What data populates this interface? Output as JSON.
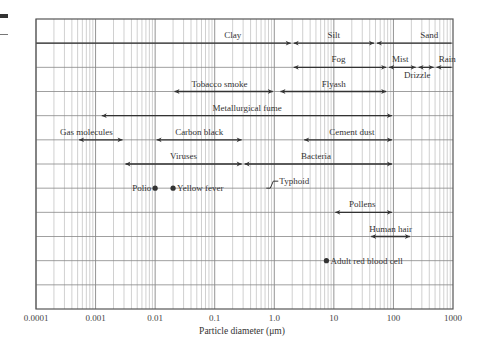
{
  "chart_data": {
    "type": "range-chart",
    "title": "",
    "xlabel": "Particle diameter (μm)",
    "ylabel": "",
    "xscale": "log",
    "xlim": [
      0.0001,
      1000
    ],
    "x_ticks": [
      "0.0001",
      "0.001",
      "0.01",
      "0.1",
      "1.0",
      "10",
      "100",
      "1000"
    ],
    "grid": true,
    "rows": 12,
    "ranges": [
      {
        "label": "Clay",
        "row": 1,
        "min": 0.0001,
        "max": 2,
        "left_open": true,
        "label_x": 0.2
      },
      {
        "label": "Silt",
        "row": 1,
        "min": 2,
        "max": 50,
        "label_x": 10
      },
      {
        "label": "Sand",
        "row": 1,
        "min": 50,
        "max": 1000,
        "label_x": 400
      },
      {
        "label": "Fog",
        "row": 2,
        "min": 2,
        "max": 80,
        "label_x": 12
      },
      {
        "label": "Mist",
        "row": 2,
        "min": 80,
        "max": 250,
        "label_x": 130
      },
      {
        "label": "Drizzle",
        "row": 2,
        "min": 250,
        "max": 500,
        "label_x": 250,
        "label_below": true
      },
      {
        "label": "Rain",
        "row": 2,
        "min": 500,
        "max": 1000,
        "label_x": 800
      },
      {
        "label": "Tobacco smoke",
        "row": 3,
        "min": 0.02,
        "max": 1,
        "label_x": 0.12
      },
      {
        "label": "Flyash",
        "row": 3,
        "min": 1.2,
        "max": 80,
        "label_x": 10
      },
      {
        "label": "Metallurgical fume",
        "row": 4,
        "min": 0.0012,
        "max": 100,
        "label_x": 0.35
      },
      {
        "label": "Gas molecules",
        "row": 5,
        "min": 0.0005,
        "max": 0.003,
        "label_x": 0.0007
      },
      {
        "label": "Carbon black",
        "row": 5,
        "min": 0.01,
        "max": 0.3,
        "label_x": 0.055
      },
      {
        "label": "Cement dust",
        "row": 5,
        "min": 3,
        "max": 100,
        "label_x": 20
      },
      {
        "label": "Viruses",
        "row": 6,
        "min": 0.003,
        "max": 0.3,
        "label_x": 0.03
      },
      {
        "label": "Bacteria",
        "row": 6,
        "min": 0.3,
        "max": 100,
        "label_x": 5
      },
      {
        "label": "Pollens",
        "row": 8,
        "min": 10,
        "max": 100,
        "label_x": 30
      },
      {
        "label": "Human hair",
        "row": 9,
        "min": 40,
        "max": 200,
        "label_x": 90
      }
    ],
    "points": [
      {
        "label": "Polio",
        "row": 7,
        "x": 0.01,
        "label_side": "left"
      },
      {
        "label": "Yellow fever",
        "row": 7,
        "x": 0.02,
        "label_side": "right"
      },
      {
        "label": "Typhoid",
        "row": 7,
        "x": 1.0,
        "marker": "bracket",
        "label_side": "right"
      },
      {
        "label": "Adult red blood cell",
        "row": 10,
        "x": 7.5,
        "label_side": "right"
      }
    ]
  },
  "colors": {
    "frame": "#555555",
    "grid_major": "#888888",
    "grid_minor": "#b0b0b0",
    "arrow": "#333333",
    "text": "#333333"
  }
}
